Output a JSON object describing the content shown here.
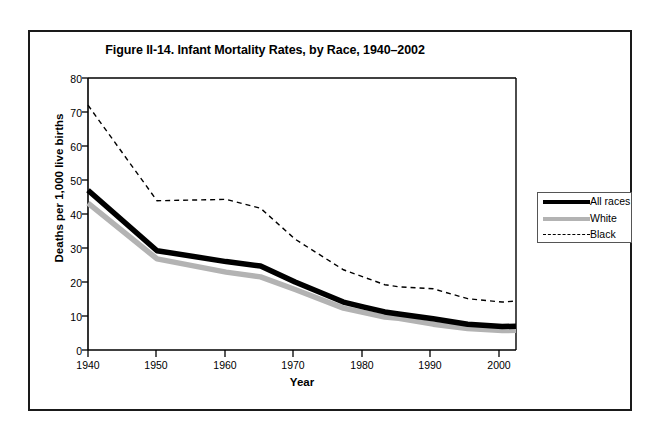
{
  "figure": {
    "title": "Figure II-14. Infant Mortality Rates, by Race, 1940–2002"
  },
  "legend": {
    "items": [
      {
        "label": "All races",
        "style": "thick-solid-black",
        "color": "#000000"
      },
      {
        "label": "White",
        "style": "thick-solid-gray",
        "color": "#b3b3b3"
      },
      {
        "label": "Black",
        "style": "thin-dashed-black",
        "color": "#000000"
      }
    ]
  },
  "chart_data": {
    "type": "line",
    "title": "Figure II-14. Infant Mortality Rates, by Race, 1940–2002",
    "xlabel": "Year",
    "ylabel": "Deaths per 1,000 live births",
    "xlim": [
      1940,
      2002
    ],
    "ylim": [
      0,
      80
    ],
    "yticks": [
      0,
      10,
      20,
      30,
      40,
      50,
      60,
      70,
      80
    ],
    "xticks": [
      1940,
      1950,
      1960,
      1970,
      1980,
      1990,
      2000
    ],
    "grid": false,
    "legend_position": "right-outside",
    "x": [
      1940,
      1950,
      1960,
      1965,
      1970,
      1977,
      1980,
      1983,
      1985,
      1990,
      1995,
      2000,
      2002
    ],
    "series": [
      {
        "name": "All races",
        "color": "#000000",
        "style": "thick-solid",
        "values": [
          47.0,
          29.2,
          26.0,
          24.7,
          20.0,
          14.1,
          12.6,
          11.2,
          10.6,
          9.2,
          7.6,
          6.9,
          7.0
        ]
      },
      {
        "name": "White",
        "color": "#b3b3b3",
        "style": "thick-solid",
        "values": [
          43.2,
          26.8,
          22.9,
          21.5,
          17.8,
          12.3,
          11.0,
          9.7,
          9.3,
          7.6,
          6.3,
          5.7,
          5.8
        ]
      },
      {
        "name": "Black",
        "color": "#000000",
        "style": "thin-dashed",
        "values": [
          72.0,
          43.9,
          44.3,
          41.7,
          32.6,
          23.6,
          21.4,
          19.2,
          18.6,
          18.0,
          15.1,
          14.1,
          14.4
        ]
      }
    ]
  }
}
